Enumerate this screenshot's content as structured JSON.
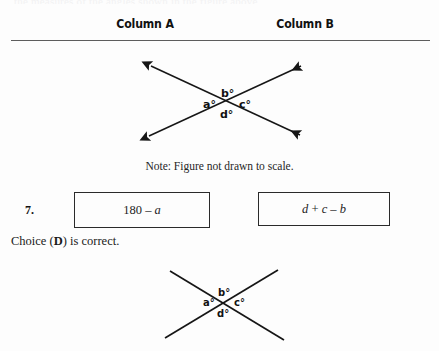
{
  "page": {
    "cut_off_top_text": "the measures of the angles shown in the figure above",
    "note": "Note: Figure not drawn to scale."
  },
  "header": {
    "column_a": "Column A",
    "column_b": "Column B"
  },
  "question": {
    "number": "7.",
    "column_a_expression_prefix": "180 – ",
    "column_a_expression_var": "a",
    "column_b_expression": "d + c – b",
    "column_b_parts": {
      "d": "d",
      "plus": " + ",
      "c": "c",
      "minus": " – ",
      "b": "b"
    }
  },
  "answer": {
    "text_before": "Choice (",
    "letter": "D",
    "text_after": ") is correct."
  },
  "figure_top": {
    "labels": {
      "a": "a°",
      "b": "b°",
      "c": "c°",
      "d": "d°"
    },
    "description": "Two straight lines crossing in an X shape with arrowheads on all four ends"
  },
  "figure_bottom": {
    "labels": {
      "a": "a°",
      "b": "b°",
      "c": "c°",
      "d": "d°"
    },
    "description": "Two straight lines crossing in an X shape without arrowheads, cropped at bottom"
  },
  "colors": {
    "ink": "#1a1a1a",
    "rule": "#5d5d5d",
    "background": "#fdfdfd",
    "box_border": "#2a2a2a"
  }
}
